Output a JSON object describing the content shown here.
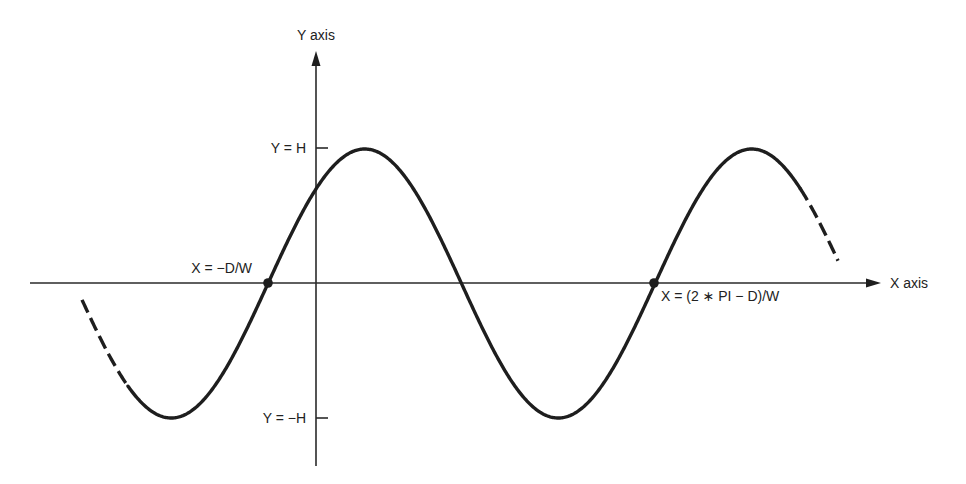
{
  "diagram": {
    "type": "sine-wave-axes",
    "colors": {
      "ink": "#1e1e1e",
      "axis": "#2a2a2a",
      "background": "#ffffff"
    },
    "axes": {
      "x_label": "X axis",
      "y_label": "Y axis"
    },
    "ticks": {
      "y_max_label": "Y = H",
      "y_min_label": "Y = −H"
    },
    "points": [
      {
        "label": "X = −D/W"
      },
      {
        "label": "X = (2 ∗ PI − D)/W"
      }
    ],
    "curve": {
      "function": "Y = H * sin(W*X + D)",
      "solid_range_px": [
        128,
        800
      ],
      "dashed_ends": true
    }
  }
}
